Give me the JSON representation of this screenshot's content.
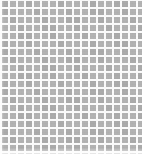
{
  "image": {
    "kind": "texture-swatch",
    "description": "Uniform grid of gray square tiles separated by white grout lines",
    "width_px": 142,
    "height_px": 154
  },
  "pattern": {
    "name": "square-tile-grid",
    "columns": 18,
    "rows": 20,
    "cell_pitch_x_px": 8,
    "cell_pitch_y_px": 8,
    "tile_size_px": 6,
    "gap_px": 2,
    "origin_offset_x_px": 2,
    "origin_offset_y_px": 1
  },
  "colors": {
    "tile_fill": "#b2b2b2",
    "tile_fill_alt": "#aaaaaa",
    "grout": "#fbfbfb",
    "background": "#ffffff",
    "page_background": "#ffffff"
  },
  "text": {
    "labels": [],
    "note": "No text, icons, or UI controls are present in this image."
  }
}
